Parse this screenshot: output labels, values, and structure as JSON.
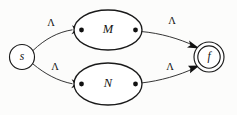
{
  "diagram": {
    "type": "nfa-state-diagram",
    "background_color": "#fcfcfb",
    "stroke_color": "#1a1a1a",
    "states": {
      "start": {
        "label": "s",
        "name": "start-state",
        "shape": "circle",
        "accepting": false,
        "cx": 22,
        "cy": 57,
        "r": 12.5
      },
      "final": {
        "label": "f",
        "name": "final-state",
        "shape": "double-circle",
        "accepting": true,
        "cx": 209,
        "cy": 57,
        "r_outer": 15,
        "r_inner": 11.2
      }
    },
    "submachines": [
      {
        "label": "M",
        "name": "submachine-m",
        "cx": 108,
        "cy": 30,
        "rx": 34,
        "ry": 20,
        "entry_port": {
          "x": 80,
          "y": 30
        },
        "exit_port": {
          "x": 136,
          "y": 30
        }
      },
      {
        "label": "N",
        "name": "submachine-n",
        "cx": 108,
        "cy": 84,
        "rx": 34,
        "ry": 21,
        "entry_port": {
          "x": 80,
          "y": 84
        },
        "exit_port": {
          "x": 136,
          "y": 84
        }
      }
    ],
    "transitions": [
      {
        "name": "transition-start-to-m",
        "label": "Λ",
        "from": "s",
        "to": "M",
        "label_x": 51,
        "label_y": 24
      },
      {
        "name": "transition-start-to-n",
        "label": "Λ",
        "from": "s",
        "to": "N",
        "label_x": 55,
        "label_y": 68
      },
      {
        "name": "transition-m-to-final",
        "label": "Λ",
        "from": "M",
        "to": "f",
        "label_x": 172,
        "label_y": 22
      },
      {
        "name": "transition-n-to-final",
        "label": "Λ",
        "from": "N",
        "to": "f",
        "label_x": 170,
        "label_y": 68
      }
    ]
  }
}
